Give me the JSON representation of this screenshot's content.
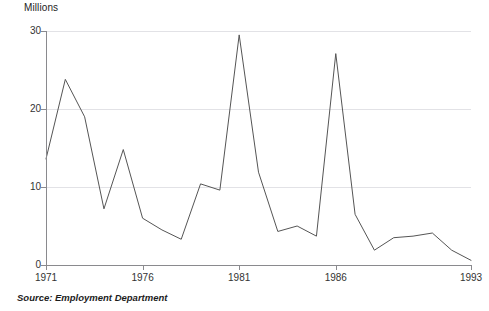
{
  "chart_data": {
    "type": "line",
    "title": "",
    "subtitle": "",
    "ylabel": "Millions",
    "xlabel": "",
    "ylim": [
      0,
      30
    ],
    "xlim": [
      1971,
      1993
    ],
    "grid": true,
    "legend": false,
    "y_ticks": [
      0,
      10,
      20,
      30
    ],
    "y_tick_labels": [
      "0",
      "10",
      "20",
      "30"
    ],
    "x_ticks": [
      1971,
      1976,
      1981,
      1986,
      1993
    ],
    "x_tick_labels": [
      "1971",
      "1976",
      "1981",
      "1986",
      "1993"
    ],
    "series": [
      {
        "name": "Working days lost",
        "color": "#555555",
        "x": [
          1971,
          1972,
          1973,
          1974,
          1975,
          1976,
          1977,
          1978,
          1979,
          1980,
          1981,
          1982,
          1983,
          1984,
          1985,
          1986,
          1987,
          1988,
          1989,
          1990,
          1991,
          1992,
          1993
        ],
        "values": [
          13.6,
          23.8,
          19.0,
          7.2,
          14.8,
          6.0,
          4.5,
          3.3,
          10.4,
          9.6,
          29.5,
          11.9,
          4.3,
          5.0,
          3.7,
          27.1,
          6.5,
          1.9,
          3.5,
          3.7,
          4.1,
          1.9,
          0.6
        ]
      }
    ],
    "annotations": {
      "source": "Source: Employment Department"
    }
  },
  "chart": {
    "axis_title_y": "Millions",
    "source_label": "Source: Employment Department"
  }
}
